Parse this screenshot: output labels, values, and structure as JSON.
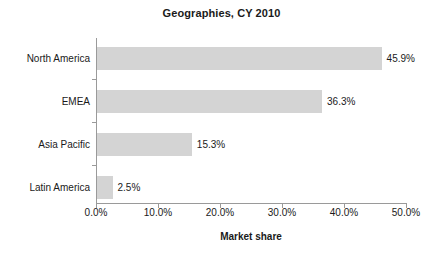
{
  "chart_data": {
    "type": "bar",
    "orientation": "horizontal",
    "title": "Geographies, CY 2010",
    "xlabel": "Market share",
    "ylabel": "",
    "categories": [
      "North America",
      "EMEA",
      "Asia Pacific",
      "Latin America"
    ],
    "values": [
      45.9,
      36.3,
      15.3,
      2.5
    ],
    "data_labels": [
      "45.9%",
      "36.3%",
      "15.3%",
      "2.5%"
    ],
    "xlim": [
      0,
      50
    ],
    "xticks": [
      0,
      10,
      20,
      30,
      40,
      50
    ],
    "xtick_labels": [
      "0.0%",
      "10.0%",
      "20.0%",
      "30.0%",
      "40.0%",
      "50.0%"
    ],
    "grid": false,
    "legend": false,
    "bar_color": "#d4d4d4",
    "axis_color": "#9a9a9a",
    "text_color": "#1a1a1a",
    "background": "#ffffff"
  }
}
